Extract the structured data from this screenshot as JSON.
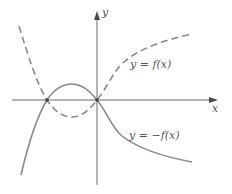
{
  "figure": {
    "axes": {
      "x_label": "x",
      "y_label": "y"
    },
    "curves": [
      {
        "name": "f",
        "label": "y = f(x)",
        "style": "dashed",
        "color": "#8a8a8a"
      },
      {
        "name": "neg-f",
        "label": "y = −f(x)",
        "style": "solid",
        "color": "#8a8a8a"
      }
    ],
    "intersection_points": [
      "left-root",
      "origin"
    ],
    "colors": {
      "axis": "#6a6a6a",
      "curve": "#8a8a8a",
      "text": "#555555",
      "background": "#ffffff"
    }
  }
}
